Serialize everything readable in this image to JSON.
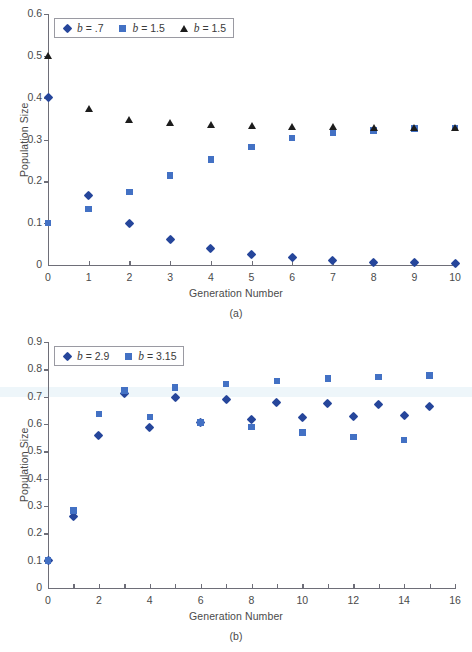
{
  "figures": [
    {
      "id": "a",
      "caption": "(a)",
      "xlabel": "Generation Number",
      "ylabel": "Population Size"
    },
    {
      "id": "b",
      "caption": "(b)",
      "xlabel": "Generation Number",
      "ylabel": "Population Size"
    }
  ],
  "chart_data": [
    {
      "type": "scatter",
      "panel": "(a)",
      "title": "",
      "xlabel": "Generation Number",
      "ylabel": "Population Size",
      "xlim": [
        0,
        10
      ],
      "ylim": [
        0,
        0.6
      ],
      "xticks": [
        0,
        1,
        2,
        3,
        4,
        5,
        6,
        7,
        8,
        9,
        10
      ],
      "xticklabels": [
        "0",
        "1",
        "2",
        "3",
        "4",
        "5",
        "6",
        "7",
        "8",
        "9",
        "10"
      ],
      "yticks": [
        0,
        0.1,
        0.2,
        0.3,
        0.4,
        0.5,
        0.6
      ],
      "yticklabels": [
        "0",
        "0.1",
        "0.2",
        "0.3",
        "0.4",
        "0.5",
        "0.6"
      ],
      "grid": false,
      "legend_position": "top-left",
      "series": [
        {
          "name": "b = .7",
          "label_prefix": "b",
          "label_value": "= .7",
          "marker": "diamond",
          "color": "#26469b",
          "x": [
            0,
            1,
            2,
            3,
            4,
            5,
            6,
            7,
            8,
            9,
            10
          ],
          "values": [
            0.4,
            0.167,
            0.099,
            0.062,
            0.04,
            0.026,
            0.017,
            0.011,
            0.007,
            0.005,
            0.003
          ]
        },
        {
          "name": "b = 1.5",
          "label_prefix": "b",
          "label_value": "= 1.5",
          "marker": "square",
          "color": "#4371c4",
          "x": [
            0,
            1,
            2,
            3,
            4,
            5,
            6,
            7,
            8,
            9,
            10
          ],
          "values": [
            0.1,
            0.134,
            0.174,
            0.214,
            0.252,
            0.282,
            0.303,
            0.315,
            0.322,
            0.326,
            0.328
          ]
        },
        {
          "name": "b = 1.5",
          "label_prefix": "b",
          "label_value": "= 1.5",
          "marker": "triangle",
          "color": "#1c1c1c",
          "x": [
            0,
            1,
            2,
            3,
            4,
            5,
            6,
            7,
            8,
            9,
            10
          ],
          "values": [
            0.5,
            0.374,
            0.349,
            0.34,
            0.335,
            0.333,
            0.331,
            0.33,
            0.329,
            0.329,
            0.329
          ]
        }
      ]
    },
    {
      "type": "scatter",
      "panel": "(b)",
      "title": "",
      "xlabel": "Generation Number",
      "ylabel": "Population Size",
      "xlim": [
        0,
        16
      ],
      "ylim": [
        0,
        0.9
      ],
      "xticks": [
        0,
        2,
        4,
        6,
        8,
        10,
        12,
        14,
        16
      ],
      "xticklabels": [
        "0",
        "2",
        "4",
        "6",
        "8",
        "10",
        "12",
        "14",
        "16"
      ],
      "xminorticks": [
        1,
        3,
        5,
        7,
        9,
        11,
        13,
        15
      ],
      "yticks": [
        0,
        0.1,
        0.2,
        0.3,
        0.4,
        0.5,
        0.6,
        0.7,
        0.8,
        0.9
      ],
      "yticklabels": [
        "0",
        "0.1",
        "0.2",
        "0.3",
        "0.4",
        "0.5",
        "0.6",
        "0.7",
        "0.8",
        "0.9"
      ],
      "grid": false,
      "legend_position": "top-left",
      "series": [
        {
          "name": "b = 2.9",
          "label_prefix": "b",
          "label_value": "= 2.9",
          "marker": "diamond",
          "color": "#26469b",
          "x": [
            0,
            1,
            2,
            3,
            4,
            5,
            6,
            7,
            8,
            9,
            10,
            11,
            12,
            13,
            14,
            15
          ],
          "values": [
            0.1,
            0.26,
            0.558,
            0.713,
            0.589,
            0.698,
            0.606,
            0.688,
            0.616,
            0.68,
            0.623,
            0.674,
            0.628,
            0.67,
            0.632,
            0.665
          ]
        },
        {
          "name": "b = 3.15",
          "label_prefix": "b",
          "label_value": "= 3.15",
          "marker": "square",
          "color": "#4371c4",
          "x": [
            0,
            1,
            2,
            3,
            4,
            5,
            6,
            7,
            8,
            9,
            10,
            11,
            12,
            13,
            14,
            15
          ],
          "values": [
            0.1,
            0.284,
            0.637,
            0.722,
            0.625,
            0.734,
            0.606,
            0.746,
            0.589,
            0.757,
            0.569,
            0.766,
            0.553,
            0.772,
            0.542,
            0.777
          ]
        }
      ]
    }
  ]
}
